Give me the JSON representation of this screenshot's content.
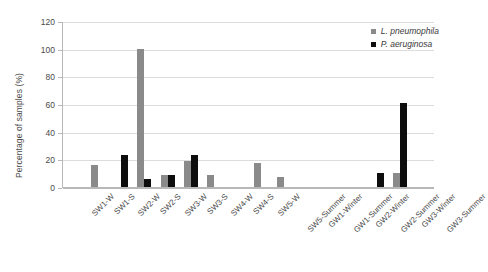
{
  "chart_data": {
    "type": "bar",
    "title": "",
    "xlabel": "",
    "ylabel": "Percentage of samples (%)",
    "ylim": [
      0,
      120
    ],
    "yticks": [
      0,
      20,
      40,
      60,
      80,
      100,
      120
    ],
    "grid": "horizontal",
    "legend_position": "top-right",
    "categories": [
      "SW1-W",
      "SW1-S",
      "SW2-W",
      "SW2-S",
      "SW3-W",
      "SW3-S",
      "SW4-W",
      "SW4-S",
      "SW5-W",
      "SW5-Summer",
      "GW1-Winter",
      "GW1-Summer",
      "GW2-Winter",
      "GW2-Summer",
      "GW3-Winter",
      "GW3-Summer"
    ],
    "series": [
      {
        "name": "L. pneumophila",
        "color": "#8a8a8a",
        "values": [
          0,
          16,
          0,
          100,
          9,
          19,
          9,
          0,
          17,
          7,
          0,
          0,
          0,
          0,
          10,
          0
        ]
      },
      {
        "name": "P. aeruginosa",
        "color": "#0d0d0d",
        "values": [
          0,
          0,
          23,
          6,
          9,
          23,
          0,
          0,
          0,
          0,
          0,
          0,
          0,
          10,
          61,
          0
        ]
      }
    ]
  },
  "axis": {
    "y_title": "Percentage of samples (%)"
  }
}
